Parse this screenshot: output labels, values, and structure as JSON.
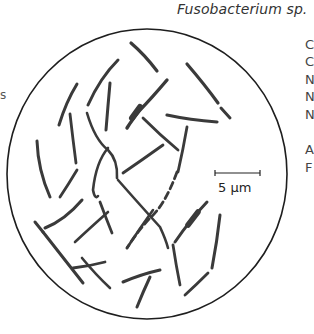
{
  "figure": {
    "title": "Fusobacterium sp.",
    "scale_bar": {
      "label": "5 µm"
    },
    "right_margin_letters": [
      "C",
      "C",
      "N",
      "N",
      "N",
      "A",
      "F"
    ],
    "left_margin_letters": [
      "s"
    ],
    "colors": {
      "rod": "#3a3a3a",
      "outline": "#1e1e1e",
      "background": "#ffffff"
    }
  }
}
